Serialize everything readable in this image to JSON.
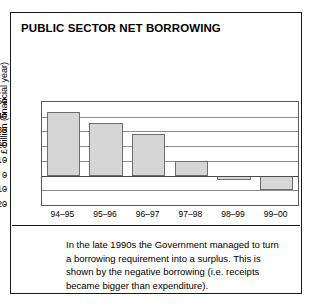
{
  "figure": {
    "title": "PUBLIC SECTOR NET BORROWING",
    "caption": "In the late 1990s the Government managed to turn a borrowing requirement into a surplus. This is shown by the negative borrowing (i.e. receipts became bigger than expenditure)."
  },
  "colors": {
    "bar_fill": "#d6d6d6",
    "bar_edge": "#6e6e6e",
    "frame": "#1a1a1a",
    "grid": "#8d8d8d",
    "text": "#000000"
  },
  "chart_data": {
    "type": "bar",
    "title": "PUBLIC SECTOR NET BORROWING",
    "xlabel": "",
    "ylabel": "£ billion (financial year)",
    "categories": [
      "94–95",
      "95–96",
      "96–97",
      "97–98",
      "98–99",
      "99–00"
    ],
    "values": [
      43,
      36,
      28,
      10,
      -3,
      -10
    ],
    "ylim": [
      -20,
      50
    ],
    "yticks": [
      50,
      40,
      30,
      20,
      10,
      0,
      -10,
      -20
    ],
    "ytick_labels": [
      "50",
      "40",
      "30",
      "20",
      "10",
      "0",
      "-10",
      "-20"
    ],
    "grid": true,
    "legend": false,
    "annotation": "In the late 1990s the Government managed to turn a borrowing requirement into a surplus. This is shown by the negative borrowing (i.e. receipts became bigger than expenditure)."
  }
}
